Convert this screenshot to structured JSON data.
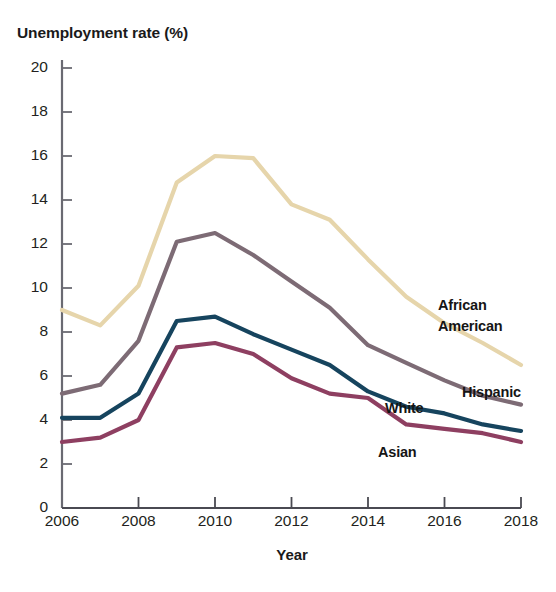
{
  "chart_data": {
    "type": "line",
    "title": "",
    "ylabel": "Unemployment rate (%)",
    "xlabel": "Year",
    "x": [
      2006,
      2007,
      2008,
      2009,
      2010,
      2011,
      2012,
      2013,
      2014,
      2015,
      2016,
      2017,
      2018
    ],
    "xlim": [
      2006,
      2018
    ],
    "ylim": [
      0,
      20
    ],
    "xticks": [
      "2006",
      "2008",
      "2010",
      "2012",
      "2014",
      "2016",
      "2018"
    ],
    "yticks": [
      "0",
      "2",
      "4",
      "6",
      "8",
      "10",
      "12",
      "14",
      "16",
      "18",
      "20"
    ],
    "grid": false,
    "legend_position": "inline-right",
    "series": [
      {
        "name": "African American",
        "color": "#e6d5ab",
        "values": [
          9.0,
          8.3,
          10.1,
          14.8,
          16.0,
          15.9,
          13.8,
          13.1,
          11.3,
          9.6,
          8.4,
          7.5,
          6.5
        ]
      },
      {
        "name": "Hispanic",
        "color": "#7d6b75",
        "values": [
          5.2,
          5.6,
          7.6,
          12.1,
          12.5,
          11.5,
          10.3,
          9.1,
          7.4,
          6.6,
          5.8,
          5.1,
          4.7
        ]
      },
      {
        "name": "White",
        "color": "#16445e",
        "values": [
          4.1,
          4.1,
          5.2,
          8.5,
          8.7,
          7.9,
          7.2,
          6.5,
          5.3,
          4.6,
          4.3,
          3.8,
          3.5
        ]
      },
      {
        "name": "Asian",
        "color": "#8e3f61",
        "values": [
          3.0,
          3.2,
          4.0,
          7.3,
          7.5,
          7.0,
          5.9,
          5.2,
          5.0,
          3.8,
          3.6,
          3.4,
          3.0
        ]
      }
    ],
    "annotations": [
      {
        "text": "African",
        "series": "African American",
        "x_px": 438,
        "y_px": 297
      },
      {
        "text": "American",
        "series": "African American",
        "x_px": 438,
        "y_px": 318
      },
      {
        "text": "Hispanic",
        "series": "Hispanic",
        "x_px": 462,
        "y_px": 384
      },
      {
        "text": "White",
        "series": "White",
        "x_px": 385,
        "y_px": 400
      },
      {
        "text": "Asian",
        "series": "Asian",
        "x_px": 378,
        "y_px": 444
      }
    ]
  },
  "caption": {
    "partial_text": ""
  }
}
